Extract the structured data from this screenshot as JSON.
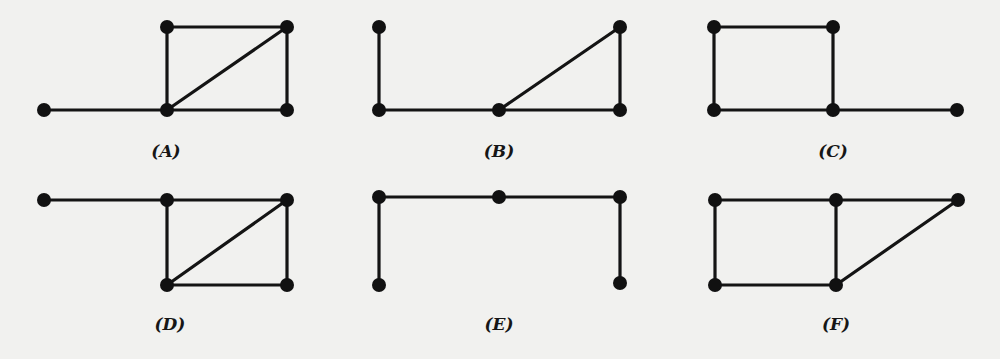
{
  "graphs": [
    {
      "id": "A",
      "label": "(A)",
      "label_pos": [
        166,
        157
      ],
      "nodes": [
        [
          44,
          110
        ],
        [
          167,
          27
        ],
        [
          287,
          27
        ],
        [
          167,
          110
        ],
        [
          287,
          110
        ]
      ],
      "edges": [
        [
          0,
          3
        ],
        [
          3,
          4
        ],
        [
          1,
          2
        ],
        [
          1,
          3
        ],
        [
          2,
          4
        ],
        [
          3,
          2
        ]
      ]
    },
    {
      "id": "B",
      "label": "(B)",
      "label_pos": [
        499,
        157
      ],
      "nodes": [
        [
          379,
          27
        ],
        [
          379,
          110
        ],
        [
          499,
          110
        ],
        [
          620,
          27
        ],
        [
          620,
          110
        ]
      ],
      "edges": [
        [
          0,
          1
        ],
        [
          1,
          2
        ],
        [
          2,
          4
        ],
        [
          2,
          3
        ],
        [
          3,
          4
        ]
      ]
    },
    {
      "id": "C",
      "label": "(C)",
      "label_pos": [
        833,
        157
      ],
      "nodes": [
        [
          714,
          27
        ],
        [
          833,
          27
        ],
        [
          714,
          110
        ],
        [
          833,
          110
        ],
        [
          957,
          110
        ]
      ],
      "edges": [
        [
          0,
          1
        ],
        [
          0,
          2
        ],
        [
          1,
          3
        ],
        [
          2,
          3
        ],
        [
          3,
          4
        ]
      ]
    },
    {
      "id": "D",
      "label": "(D)",
      "label_pos": [
        170,
        330
      ],
      "nodes": [
        [
          44,
          200
        ],
        [
          167,
          200
        ],
        [
          287,
          200
        ],
        [
          167,
          285
        ],
        [
          287,
          285
        ]
      ],
      "edges": [
        [
          0,
          1
        ],
        [
          1,
          2
        ],
        [
          1,
          3
        ],
        [
          3,
          4
        ],
        [
          2,
          4
        ],
        [
          3,
          2
        ]
      ]
    },
    {
      "id": "E",
      "label": "(E)",
      "label_pos": [
        499,
        330
      ],
      "nodes": [
        [
          379,
          197
        ],
        [
          499,
          197
        ],
        [
          620,
          197
        ],
        [
          379,
          285
        ],
        [
          620,
          283
        ]
      ],
      "edges": [
        [
          0,
          1
        ],
        [
          1,
          2
        ],
        [
          0,
          3
        ],
        [
          2,
          4
        ]
      ]
    },
    {
      "id": "F",
      "label": "(F)",
      "label_pos": [
        836,
        330
      ],
      "nodes": [
        [
          715,
          200
        ],
        [
          836,
          200
        ],
        [
          958,
          200
        ],
        [
          715,
          285
        ],
        [
          836,
          285
        ]
      ],
      "edges": [
        [
          0,
          1
        ],
        [
          1,
          2
        ],
        [
          0,
          3
        ],
        [
          3,
          4
        ],
        [
          1,
          4
        ],
        [
          4,
          2
        ]
      ]
    }
  ],
  "style": {
    "node_radius": 7,
    "stroke_color": "#141414",
    "background": "#f1f1ef"
  }
}
